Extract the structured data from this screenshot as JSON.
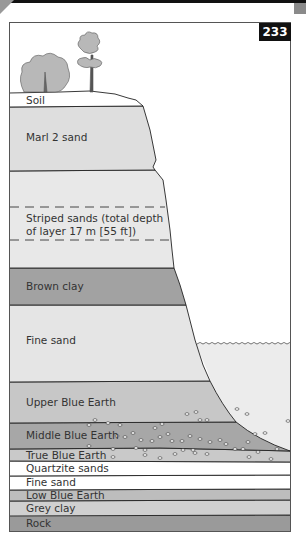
{
  "page_number": "233",
  "colors": {
    "soil": "#ffffff",
    "marl": "#dedede",
    "striped": "#e8e8e8",
    "brown_clay": "#a2a2a2",
    "fine_sand": "#e5e5e5",
    "upper_blue": "#c7c7c7",
    "middle_blue": "#a7a7a7",
    "true_blue": "#c9c9c9",
    "quartzite": "#ffffff",
    "fine_sand_lower": "#ffffff",
    "low_blue": "#bdbdbd",
    "grey_clay": "#d0d0d0",
    "rock": "#9a9a9a",
    "water": "#ececec",
    "outline": "#222222"
  },
  "layers": [
    {
      "label": "Soil"
    },
    {
      "label": "Marl 2 sand"
    },
    {
      "label_line1": "Striped sands (total depth",
      "label_line2": "of layer 17 m [55 ft])"
    },
    {
      "label": "Brown clay"
    },
    {
      "label": "Fine sand"
    },
    {
      "label": "Upper Blue Earth"
    },
    {
      "label": "Middle Blue Earth"
    },
    {
      "label": "True Blue Earth"
    },
    {
      "label": "Quartzite sands"
    },
    {
      "label": "Fine sand"
    },
    {
      "label": "Low Blue Earth"
    },
    {
      "label": "Grey clay"
    },
    {
      "label": "Rock"
    }
  ]
}
